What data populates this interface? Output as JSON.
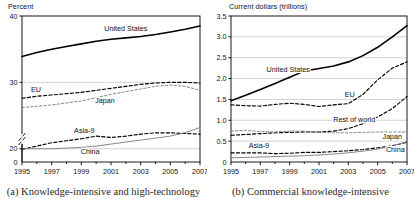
{
  "figure": {
    "panels": [
      {
        "id": "a",
        "caption": "(a) Knowledge-intensive and high-technology",
        "axis_title": "Percent"
      },
      {
        "id": "b",
        "caption": "(b) Commercial knowledge-intensive",
        "axis_title": "Current dollars (trillions)"
      }
    ]
  },
  "chart_data": [
    {
      "type": "line",
      "panel": "a",
      "title": "(a) Knowledge-intensive and high-technology",
      "xlabel": "",
      "ylabel": "Percent",
      "ylim": [
        0,
        40
      ],
      "axis_break": true,
      "grid": true,
      "legend": "inline-labels",
      "yticks": [
        0,
        20,
        30,
        40
      ],
      "ytick_labels": [
        "0",
        "20",
        "30",
        "40"
      ],
      "x": [
        1995,
        1996,
        1997,
        1998,
        1999,
        2000,
        2001,
        2002,
        2003,
        2004,
        2005,
        2006,
        2007
      ],
      "xticks": [
        1995,
        1997,
        1999,
        2001,
        2003,
        2005,
        2007
      ],
      "xtick_labels": [
        "1995",
        "1997",
        "1999",
        "2001",
        "2003",
        "2005",
        "2007"
      ],
      "series": [
        {
          "name": "United States",
          "style": "solid-thick",
          "values": [
            33.9,
            34.5,
            35.0,
            35.4,
            35.8,
            36.2,
            36.5,
            36.7,
            36.9,
            37.2,
            37.6,
            38.0,
            38.5
          ]
        },
        {
          "name": "EU",
          "style": "dashed",
          "values": [
            27.6,
            27.9,
            28.1,
            28.3,
            28.5,
            28.8,
            29.1,
            29.4,
            29.7,
            29.9,
            30.0,
            30.0,
            29.9
          ]
        },
        {
          "name": "Japan",
          "style": "thin-dashed-gray",
          "values": [
            26.2,
            26.4,
            26.6,
            26.9,
            27.2,
            27.7,
            28.2,
            28.6,
            29.0,
            29.4,
            29.6,
            29.4,
            28.8
          ]
        },
        {
          "name": "Asia-9",
          "style": "dashed",
          "values": [
            19.9,
            20.4,
            20.9,
            21.2,
            21.5,
            21.9,
            21.7,
            21.9,
            22.2,
            22.4,
            22.4,
            22.3,
            22.2
          ]
        },
        {
          "name": "China",
          "style": "thin-solid-gray",
          "values": [
            20.0,
            20.0,
            20.0,
            20.1,
            20.2,
            20.4,
            20.7,
            21.0,
            21.3,
            21.6,
            21.9,
            22.4,
            23.2
          ]
        }
      ]
    },
    {
      "type": "line",
      "panel": "b",
      "title": "(b) Commercial knowledge-intensive",
      "xlabel": "",
      "ylabel": "Current dollars (trillions)",
      "ylim": [
        0,
        3.5
      ],
      "axis_break": false,
      "grid": true,
      "legend": "inline-labels",
      "yticks": [
        0,
        0.5,
        1.0,
        1.5,
        2.0,
        2.5,
        3.0,
        3.5
      ],
      "ytick_labels": [
        "0",
        "0.5",
        "1.0",
        "1.5",
        "2.0",
        "2.5",
        "3.0",
        "3.5"
      ],
      "x": [
        1995,
        1996,
        1997,
        1998,
        1999,
        2000,
        2001,
        2002,
        2003,
        2004,
        2005,
        2006,
        2007
      ],
      "xticks": [
        1995,
        1997,
        1999,
        2001,
        2003,
        2005,
        2007
      ],
      "xtick_labels": [
        "1995",
        "1997",
        "1999",
        "2001",
        "2003",
        "2005",
        "2007"
      ],
      "series": [
        {
          "name": "United States",
          "style": "solid-thick",
          "values": [
            1.47,
            1.6,
            1.74,
            1.88,
            2.03,
            2.18,
            2.24,
            2.3,
            2.4,
            2.55,
            2.75,
            3.0,
            3.27
          ]
        },
        {
          "name": "EU",
          "style": "dashed",
          "values": [
            1.37,
            1.35,
            1.34,
            1.38,
            1.41,
            1.38,
            1.33,
            1.37,
            1.4,
            1.62,
            1.97,
            2.25,
            2.4
          ]
        },
        {
          "name": "Rest of world",
          "style": "dashed",
          "values": [
            0.64,
            0.66,
            0.68,
            0.7,
            0.71,
            0.72,
            0.72,
            0.74,
            0.8,
            0.92,
            1.08,
            1.28,
            1.57
          ]
        },
        {
          "name": "Japan",
          "style": "thin-dashed-gray",
          "values": [
            0.74,
            0.76,
            0.73,
            0.72,
            0.74,
            0.74,
            0.71,
            0.7,
            0.7,
            0.71,
            0.72,
            0.72,
            0.72
          ]
        },
        {
          "name": "Asia-9",
          "style": "dashed",
          "values": [
            0.22,
            0.22,
            0.22,
            0.2,
            0.21,
            0.23,
            0.23,
            0.25,
            0.27,
            0.3,
            0.34,
            0.39,
            0.47
          ]
        },
        {
          "name": "China",
          "style": "thin-solid-gray",
          "values": [
            0.1,
            0.11,
            0.12,
            0.13,
            0.14,
            0.15,
            0.17,
            0.19,
            0.22,
            0.26,
            0.31,
            0.38,
            0.49
          ]
        }
      ]
    }
  ],
  "colors": {
    "line_primary": "#000000",
    "line_gray": "#7a7a7a",
    "grid": "#b6b6b6",
    "axis": "#000000",
    "text": "#111111",
    "background": "#ffffff"
  }
}
